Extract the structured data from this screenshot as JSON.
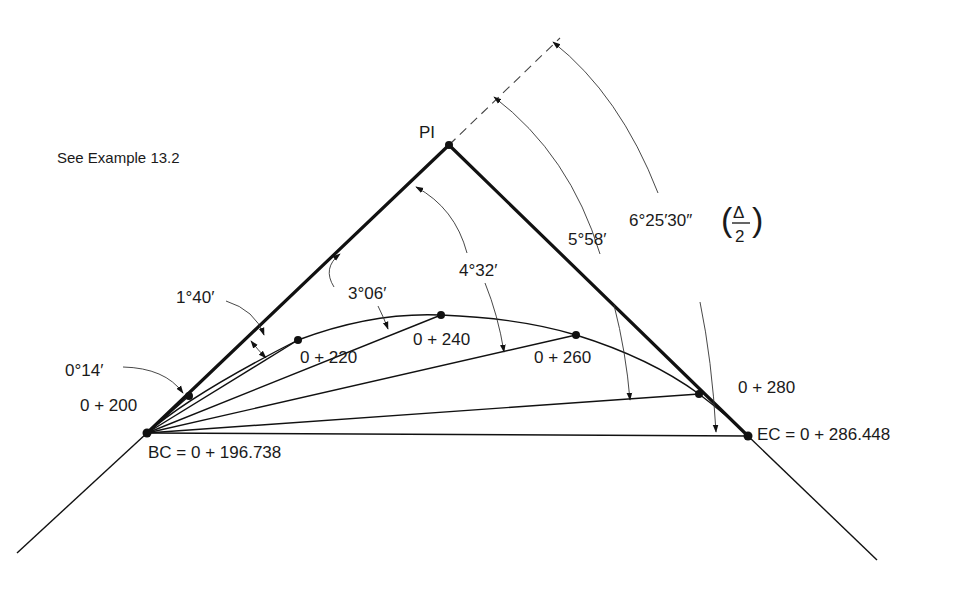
{
  "caption": "See Example  13.2",
  "points": {
    "pi": "PI",
    "bc": "BC = 0 + 196.738",
    "ec": "EC = 0 + 286.448"
  },
  "stations": {
    "s200": "0 + 200",
    "s220": "0 + 220",
    "s240": "0 + 240",
    "s260": "0 + 260",
    "s280": "0 + 280"
  },
  "deflection_angles": {
    "a200": "0°14′",
    "a220": "1°40′",
    "a240": "3°06′",
    "a260": "4°32′",
    "a280": "5°58′",
    "aEC": "6°25′30″",
    "aEC_fraction_num": "Δ",
    "aEC_fraction_den": "2"
  },
  "colors": {
    "ink": "#111111",
    "background": "#ffffff"
  }
}
